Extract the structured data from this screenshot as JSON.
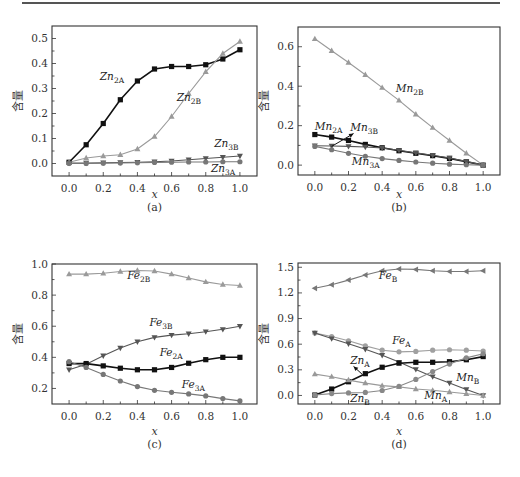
{
  "chart_data": [
    {
      "panel": "(a)",
      "type": "line",
      "title": "",
      "xlabel": "x",
      "ylabel": "含量",
      "caption": "(a)",
      "x": [
        0.0,
        0.1,
        0.2,
        0.3,
        0.4,
        0.5,
        0.6,
        0.7,
        0.8,
        0.9,
        1.0
      ],
      "xlim": [
        -0.1,
        1.1
      ],
      "ylim": [
        -0.05,
        0.55
      ],
      "xticks": [
        "0.0",
        "0.2",
        "0.4",
        "0.6",
        "0.8",
        "1.0"
      ],
      "yticks": [
        "0.0",
        "0.1",
        "0.2",
        "0.3",
        "0.4",
        "0.5"
      ],
      "ytick_values": [
        0.0,
        0.1,
        0.2,
        0.3,
        0.4,
        0.5
      ],
      "grid": false,
      "series": [
        {
          "name": "Zn2A",
          "label_main": "Zn",
          "label_sub": "2A",
          "marker": "square",
          "color": "#111111",
          "width": 1.6,
          "values": [
            0.005,
            0.075,
            0.16,
            0.255,
            0.33,
            0.378,
            0.388,
            0.388,
            0.395,
            0.418,
            0.455
          ],
          "label_pos": [
            0.18,
            0.335
          ]
        },
        {
          "name": "Zn2B",
          "label_main": "Zn",
          "label_sub": "2B",
          "marker": "triangle-up",
          "color": "#9a9a9a",
          "width": 1.1,
          "values": [
            0.005,
            0.022,
            0.03,
            0.035,
            0.058,
            0.108,
            0.188,
            0.28,
            0.367,
            0.44,
            0.488
          ],
          "label_pos": [
            0.63,
            0.25
          ]
        },
        {
          "name": "Zn3B",
          "label_main": "Zn",
          "label_sub": "3B",
          "marker": "triangle-down",
          "color": "#555555",
          "width": 1.1,
          "values": [
            0.002,
            0.002,
            0.003,
            0.004,
            0.005,
            0.007,
            0.01,
            0.015,
            0.02,
            0.025,
            0.03
          ],
          "label_pos": [
            0.85,
            0.068
          ]
        },
        {
          "name": "Zn3A",
          "label_main": "Zn",
          "label_sub": "3A",
          "marker": "circle",
          "color": "#777777",
          "width": 1.1,
          "values": [
            0.0,
            0.0,
            0.001,
            0.002,
            0.003,
            0.004,
            0.005,
            0.006,
            0.006,
            0.007,
            0.007
          ],
          "label_pos": [
            0.83,
            -0.035
          ]
        }
      ]
    },
    {
      "panel": "(b)",
      "type": "line",
      "title": "",
      "xlabel": "x",
      "ylabel": "含量",
      "caption": "(b)",
      "x": [
        0.0,
        0.1,
        0.2,
        0.3,
        0.4,
        0.5,
        0.6,
        0.7,
        0.8,
        0.9,
        1.0
      ],
      "xlim": [
        -0.1,
        1.1
      ],
      "ylim": [
        -0.05,
        0.7
      ],
      "xticks": [
        "0.0",
        "0.2",
        "0.4",
        "0.6",
        "0.8",
        "1.0"
      ],
      "yticks": [
        "0.0",
        "0.2",
        "0.4",
        "0.6"
      ],
      "ytick_values": [
        0.0,
        0.2,
        0.4,
        0.6
      ],
      "grid": false,
      "series": [
        {
          "name": "Mn2B",
          "label_main": "Mn",
          "label_sub": "2B",
          "marker": "triangle-up",
          "color": "#9a9a9a",
          "width": 1.1,
          "values": [
            0.64,
            0.58,
            0.52,
            0.458,
            0.393,
            0.328,
            0.258,
            0.19,
            0.125,
            0.06,
            0.0
          ],
          "label_pos": [
            0.48,
            0.37
          ]
        },
        {
          "name": "Mn2A",
          "label_main": "Mn",
          "label_sub": "2A",
          "marker": "square",
          "color": "#111111",
          "width": 1.6,
          "values": [
            0.155,
            0.142,
            0.125,
            0.105,
            0.088,
            0.073,
            0.06,
            0.048,
            0.034,
            0.017,
            0.0
          ],
          "label_pos": [
            0.0,
            0.18
          ]
        },
        {
          "name": "Mn3B",
          "label_main": "Mn",
          "label_sub": "3B",
          "marker": "triangle-down",
          "color": "#555555",
          "width": 1.1,
          "values": [
            0.098,
            0.097,
            0.095,
            0.092,
            0.087,
            0.075,
            0.062,
            0.05,
            0.036,
            0.019,
            0.0
          ],
          "label_pos": [
            0.21,
            0.175
          ]
        },
        {
          "name": "Mn3A",
          "label_main": "Mn",
          "label_sub": "3A",
          "marker": "circle",
          "color": "#777777",
          "width": 1.1,
          "values": [
            0.095,
            0.078,
            0.06,
            0.045,
            0.033,
            0.024,
            0.016,
            0.01,
            0.005,
            0.002,
            0.0
          ],
          "label_pos": [
            0.22,
            0.0
          ]
        }
      ],
      "annotations": [
        {
          "type": "arrow",
          "from": [
            0.1,
            0.095
          ],
          "to": [
            0.23,
            0.16
          ]
        }
      ]
    },
    {
      "panel": "(c)",
      "type": "line",
      "title": "",
      "xlabel": "x",
      "ylabel": "含量",
      "caption": "(c)",
      "x": [
        0.0,
        0.1,
        0.2,
        0.3,
        0.4,
        0.5,
        0.6,
        0.7,
        0.8,
        0.9,
        1.0
      ],
      "xlim": [
        -0.1,
        1.1
      ],
      "ylim": [
        0.1,
        1.0
      ],
      "xticks": [
        "0.0",
        "0.2",
        "0.4",
        "0.6",
        "0.8",
        "1.0"
      ],
      "yticks": [
        "0.2",
        "0.4",
        "0.6",
        "0.8",
        "1.0"
      ],
      "ytick_values": [
        0.2,
        0.4,
        0.6,
        0.8,
        1.0
      ],
      "grid": false,
      "series": [
        {
          "name": "Fe2B",
          "label_main": "Fe",
          "label_sub": "2B",
          "marker": "triangle-up",
          "color": "#9a9a9a",
          "width": 1.1,
          "values": [
            0.935,
            0.935,
            0.94,
            0.952,
            0.958,
            0.955,
            0.935,
            0.91,
            0.885,
            0.868,
            0.862
          ],
          "label_pos": [
            0.34,
            0.905
          ]
        },
        {
          "name": "Fe3B",
          "label_main": "Fe",
          "label_sub": "3B",
          "marker": "triangle-down",
          "color": "#555555",
          "width": 1.1,
          "values": [
            0.32,
            0.355,
            0.41,
            0.46,
            0.5,
            0.528,
            0.543,
            0.552,
            0.565,
            0.58,
            0.6
          ],
          "label_pos": [
            0.47,
            0.6
          ]
        },
        {
          "name": "Fe2A",
          "label_main": "Fe",
          "label_sub": "2A",
          "marker": "square",
          "color": "#111111",
          "width": 1.6,
          "values": [
            0.36,
            0.36,
            0.345,
            0.33,
            0.32,
            0.32,
            0.335,
            0.362,
            0.385,
            0.4,
            0.4
          ],
          "label_pos": [
            0.53,
            0.41
          ]
        },
        {
          "name": "Fe3A",
          "label_main": "Fe",
          "label_sub": "3A",
          "marker": "circle",
          "color": "#777777",
          "width": 1.1,
          "values": [
            0.372,
            0.335,
            0.29,
            0.248,
            0.212,
            0.188,
            0.175,
            0.165,
            0.152,
            0.135,
            0.12
          ],
          "label_pos": [
            0.66,
            0.2
          ]
        }
      ]
    },
    {
      "panel": "(d)",
      "type": "line",
      "title": "",
      "xlabel": "x",
      "ylabel": "含量",
      "caption": "(d)",
      "x": [
        0.0,
        0.1,
        0.2,
        0.3,
        0.4,
        0.5,
        0.6,
        0.7,
        0.8,
        0.9,
        1.0
      ],
      "xlim": [
        -0.1,
        1.1
      ],
      "ylim": [
        -0.1,
        1.55
      ],
      "xticks": [
        "0.0",
        "0.2",
        "0.4",
        "0.6",
        "0.8",
        "1.0"
      ],
      "yticks": [
        "0.0",
        "0.3",
        "0.6",
        "0.9",
        "1.2",
        "1.5"
      ],
      "ytick_values": [
        0.0,
        0.3,
        0.6,
        0.9,
        1.2,
        1.5
      ],
      "grid": false,
      "series": [
        {
          "name": "FeB",
          "label_main": "Fe",
          "label_sub": "B",
          "marker": "triangle-left",
          "color": "#777777",
          "width": 1.1,
          "values": [
            1.255,
            1.295,
            1.35,
            1.41,
            1.46,
            1.48,
            1.475,
            1.46,
            1.45,
            1.45,
            1.46
          ],
          "label_pos": [
            0.38,
            1.36
          ]
        },
        {
          "name": "FeA",
          "label_main": "Fe",
          "label_sub": "A",
          "marker": "circle",
          "color": "#a0a0a0",
          "width": 1.1,
          "values": [
            0.73,
            0.69,
            0.64,
            0.58,
            0.53,
            0.51,
            0.515,
            0.53,
            0.535,
            0.53,
            0.52
          ],
          "label_pos": [
            0.46,
            0.6
          ]
        },
        {
          "name": "MnB",
          "label_main": "Mn",
          "label_sub": "B",
          "marker": "triangle-down",
          "color": "#555555",
          "width": 1.1,
          "values": [
            0.73,
            0.665,
            0.605,
            0.54,
            0.47,
            0.39,
            0.305,
            0.22,
            0.145,
            0.07,
            0.0
          ],
          "label_pos": [
            0.84,
            0.17
          ]
        },
        {
          "name": "ZnA",
          "label_main": "Zn",
          "label_sub": "A",
          "marker": "square",
          "color": "#111111",
          "width": 1.6,
          "values": [
            0.005,
            0.075,
            0.16,
            0.255,
            0.33,
            0.378,
            0.388,
            0.388,
            0.395,
            0.418,
            0.455
          ],
          "label_pos": [
            0.21,
            0.37
          ]
        },
        {
          "name": "MnA",
          "label_main": "Mn",
          "label_sub": "A",
          "marker": "triangle-up",
          "color": "#999999",
          "width": 1.1,
          "values": [
            0.25,
            0.22,
            0.18,
            0.145,
            0.115,
            0.1,
            0.075,
            0.06,
            0.04,
            0.02,
            0.0
          ],
          "label_pos": [
            0.65,
            -0.045
          ]
        },
        {
          "name": "ZnB",
          "label_main": "Zn",
          "label_sub": "B",
          "marker": "circle",
          "color": "#888888",
          "width": 1.1,
          "values": [
            0.005,
            0.022,
            0.03,
            0.035,
            0.058,
            0.108,
            0.188,
            0.28,
            0.367,
            0.44,
            0.488
          ],
          "label_pos": [
            0.21,
            -0.075
          ]
        }
      ],
      "annotations": [
        {
          "type": "arrow",
          "from": [
            0.28,
            0.25
          ],
          "to": [
            0.23,
            0.34
          ]
        }
      ]
    }
  ],
  "layout": {
    "panels": [
      {
        "x0": 52,
        "x1": 257,
        "y0": 26,
        "y1": 176,
        "caption_y": 211,
        "xlabel_y": 190
      },
      {
        "x0": 298,
        "x1": 500,
        "y0": 27,
        "y1": 175,
        "caption_y": 211,
        "xlabel_y": 190
      },
      {
        "x0": 52,
        "x1": 257,
        "y0": 264,
        "y1": 404,
        "caption_y": 448,
        "xlabel_y": 427
      },
      {
        "x0": 298,
        "x1": 500,
        "y0": 263,
        "y1": 404,
        "caption_y": 448,
        "xlabel_y": 427
      }
    ]
  }
}
